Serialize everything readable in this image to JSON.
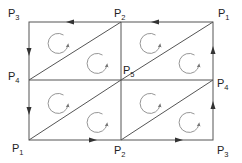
{
  "diagram": {
    "colors": {
      "line": "#555555",
      "arrow": "#333333",
      "circle": "#8a8a8a",
      "text": "#222222"
    },
    "labels": [
      {
        "id": "top-left",
        "base": "P",
        "sub": "3",
        "x": 8,
        "y": 17
      },
      {
        "id": "top-mid",
        "base": "P",
        "sub": "2",
        "x": 114,
        "y": 17
      },
      {
        "id": "top-right",
        "base": "P",
        "sub": "1",
        "x": 218,
        "y": 17
      },
      {
        "id": "mid-left",
        "base": "P",
        "sub": "4",
        "x": 8,
        "y": 80
      },
      {
        "id": "center",
        "base": "P",
        "sub": "5",
        "x": 123,
        "y": 73
      },
      {
        "id": "mid-right",
        "base": "P",
        "sub": "4",
        "x": 217,
        "y": 87
      },
      {
        "id": "bottom-left",
        "base": "P",
        "sub": "1",
        "x": 12,
        "y": 153
      },
      {
        "id": "bottom-mid",
        "base": "P",
        "sub": "2",
        "x": 115,
        "y": 155
      },
      {
        "id": "bottom-right",
        "base": "P",
        "sub": "3",
        "x": 217,
        "y": 155
      }
    ],
    "boundary_arrows": [
      {
        "edge": "top-right-segment",
        "direction": "left"
      },
      {
        "edge": "top-left-segment",
        "direction": "left"
      },
      {
        "edge": "left-upper-segment",
        "direction": "down"
      },
      {
        "edge": "left-lower-segment",
        "direction": "down"
      },
      {
        "edge": "bottom-left-segment",
        "direction": "right"
      },
      {
        "edge": "bottom-right-segment",
        "direction": "right"
      },
      {
        "edge": "right-lower-segment",
        "direction": "up"
      },
      {
        "edge": "right-upper-segment",
        "direction": "up"
      }
    ],
    "circulation": "clockwise",
    "triangle_count": 8
  }
}
